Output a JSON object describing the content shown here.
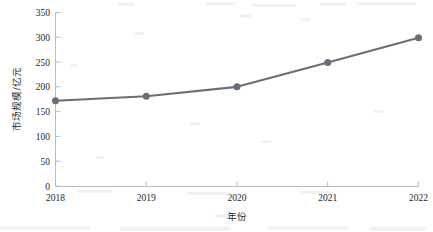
{
  "chart_data": {
    "type": "line",
    "title": "",
    "subtitle": "",
    "xlabel": "年份",
    "ylabel": "市场规模/亿元",
    "categories": [
      "2018",
      "2019",
      "2020",
      "2021",
      "2022"
    ],
    "x": [
      2018,
      2019,
      2020,
      2021,
      2022
    ],
    "series": [
      {
        "name": "市场规模",
        "values": [
          172,
          181,
          200,
          249,
          299
        ]
      }
    ],
    "xlim": [
      2018,
      2022
    ],
    "ylim": [
      0,
      350
    ],
    "ytick_labels": [
      "0",
      "50",
      "100",
      "150",
      "200",
      "250",
      "300",
      "350"
    ],
    "ytick_values": [
      0,
      50,
      100,
      150,
      200,
      250,
      300,
      350
    ],
    "xtick_labels": [
      "2018",
      "2019",
      "2020",
      "2021",
      "2022"
    ],
    "grid": false,
    "legend": false,
    "legend_position": "none",
    "line_color": "#66707a",
    "marker_color": "#66707a",
    "marker_shape": "circle",
    "axis_color": "#b9bdc1",
    "text_color": "#25282b",
    "background_color": "#ffffff",
    "annotations": []
  },
  "axes": {
    "y_axis_title": "市场规模/亿元",
    "x_axis_title": "年份"
  }
}
